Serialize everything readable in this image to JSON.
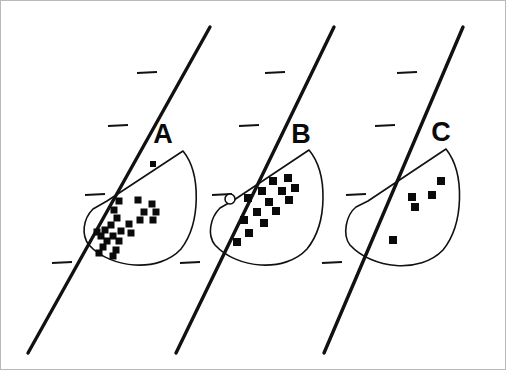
{
  "figure": {
    "title": "",
    "background_color": "#ffffff",
    "ink_color": "#0a0a0a",
    "frame_color": "#b9b9b9",
    "width": 506,
    "height": 370
  },
  "chart_data": {
    "type": "scatter",
    "title": "",
    "xlabel": "",
    "ylabel": "",
    "grid": false,
    "legend_position": "none",
    "layout": "three panels side by side, each an oblique axis line with tick marks crossing a D-shaped field envelope containing point data",
    "axis_line": {
      "style": "thick solid oblique line",
      "stroke_width": 3.4,
      "tick_count_per_panel": 4,
      "tick_side": "left",
      "tick_length": 17,
      "tick_stroke_width": 2.2
    },
    "envelope": {
      "name": "field-envelope",
      "shape": "D-shaped wedge: straight upper edge from apex to upper-right corner, then convex arc sweeping down and back to the apex",
      "stroke_width": 1.6,
      "fill": "none"
    },
    "panels": [
      {
        "id": "A",
        "label": "A",
        "label_x": 162,
        "label_y": 142,
        "axis": {
          "x1": 27,
          "y1": 352,
          "x2": 209,
          "y2": 26
        },
        "ticks": [
          {
            "x": 153,
            "y": 72
          },
          {
            "x": 124,
            "y": 125
          },
          {
            "x": 101,
            "y": 194
          },
          {
            "x": 68,
            "y": 262
          }
        ],
        "envelope_path": "M 106 200 L 182 150 C 200 172 200 222 180 248 C 158 272 110 268 88 244 C 80 234 82 218 92 208 Z",
        "n_squares": 24,
        "n_open_circles": 0,
        "squares": [
          {
            "x": 152,
            "y": 163,
            "size": 6
          },
          {
            "x": 118,
            "y": 200,
            "size": 7
          },
          {
            "x": 137,
            "y": 199,
            "size": 7
          },
          {
            "x": 151,
            "y": 203,
            "size": 7
          },
          {
            "x": 113,
            "y": 209,
            "size": 7
          },
          {
            "x": 143,
            "y": 211,
            "size": 7
          },
          {
            "x": 155,
            "y": 211,
            "size": 7
          },
          {
            "x": 116,
            "y": 217,
            "size": 7
          },
          {
            "x": 139,
            "y": 219,
            "size": 7
          },
          {
            "x": 152,
            "y": 219,
            "size": 7
          },
          {
            "x": 110,
            "y": 224,
            "size": 7
          },
          {
            "x": 128,
            "y": 223,
            "size": 7
          },
          {
            "x": 104,
            "y": 229,
            "size": 7
          },
          {
            "x": 120,
            "y": 230,
            "size": 7
          },
          {
            "x": 100,
            "y": 235,
            "size": 7
          },
          {
            "x": 112,
            "y": 235,
            "size": 7
          },
          {
            "x": 130,
            "y": 232,
            "size": 7
          },
          {
            "x": 96,
            "y": 231,
            "size": 7
          },
          {
            "x": 106,
            "y": 240,
            "size": 7
          },
          {
            "x": 118,
            "y": 240,
            "size": 7
          },
          {
            "x": 102,
            "y": 246,
            "size": 7
          },
          {
            "x": 115,
            "y": 249,
            "size": 7
          },
          {
            "x": 98,
            "y": 252,
            "size": 7
          },
          {
            "x": 112,
            "y": 255,
            "size": 7
          }
        ],
        "open_circles": []
      },
      {
        "id": "B",
        "label": "B",
        "label_x": 300,
        "label_y": 142,
        "axis": {
          "x1": 175,
          "y1": 352,
          "x2": 333,
          "y2": 26
        },
        "ticks": [
          {
            "x": 281,
            "y": 72
          },
          {
            "x": 255,
            "y": 125
          },
          {
            "x": 228,
            "y": 194
          },
          {
            "x": 196,
            "y": 262
          }
        ],
        "envelope_path": "M 233 199 L 308 149 C 327 172 327 222 306 248 C 284 272 236 268 214 244 C 206 234 209 217 219 207 Z",
        "n_squares": 14,
        "n_open_circles": 1,
        "squares": [
          {
            "x": 272,
            "y": 180,
            "size": 8
          },
          {
            "x": 287,
            "y": 177,
            "size": 8
          },
          {
            "x": 261,
            "y": 190,
            "size": 8
          },
          {
            "x": 281,
            "y": 190,
            "size": 8
          },
          {
            "x": 294,
            "y": 187,
            "size": 8
          },
          {
            "x": 247,
            "y": 197,
            "size": 8
          },
          {
            "x": 268,
            "y": 201,
            "size": 8
          },
          {
            "x": 288,
            "y": 199,
            "size": 8
          },
          {
            "x": 256,
            "y": 211,
            "size": 8
          },
          {
            "x": 275,
            "y": 210,
            "size": 8
          },
          {
            "x": 243,
            "y": 219,
            "size": 8
          },
          {
            "x": 263,
            "y": 222,
            "size": 8
          },
          {
            "x": 248,
            "y": 232,
            "size": 8
          },
          {
            "x": 236,
            "y": 241,
            "size": 8
          }
        ],
        "open_circles": [
          {
            "x": 229,
            "y": 198,
            "r": 5
          }
        ]
      },
      {
        "id": "C",
        "label": "C",
        "label_x": 440,
        "label_y": 140,
        "axis": {
          "x1": 323,
          "y1": 352,
          "x2": 462,
          "y2": 26
        },
        "ticks": [
          {
            "x": 413,
            "y": 72
          },
          {
            "x": 391,
            "y": 125
          },
          {
            "x": 362,
            "y": 194
          },
          {
            "x": 338,
            "y": 262
          }
        ],
        "envelope_path": "M 367 200 L 445 148 C 464 172 463 223 442 249 C 419 273 371 268 349 244 C 341 234 345 214 355 206 Z",
        "n_squares": 5,
        "n_open_circles": 0,
        "squares": [
          {
            "x": 440,
            "y": 180,
            "size": 8
          },
          {
            "x": 411,
            "y": 196,
            "size": 8
          },
          {
            "x": 431,
            "y": 194,
            "size": 8
          },
          {
            "x": 414,
            "y": 206,
            "size": 8
          },
          {
            "x": 392,
            "y": 239,
            "size": 8
          }
        ],
        "open_circles": []
      }
    ]
  }
}
